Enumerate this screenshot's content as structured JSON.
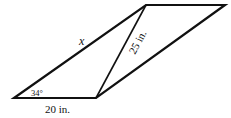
{
  "diagram": {
    "type": "parallelogram-with-diagonal",
    "labels": {
      "side_x": "x",
      "diagonal": "25 in.",
      "base": "20 in.",
      "angle": "34°"
    },
    "colors": {
      "stroke": "#111111",
      "background": "#ffffff"
    }
  }
}
